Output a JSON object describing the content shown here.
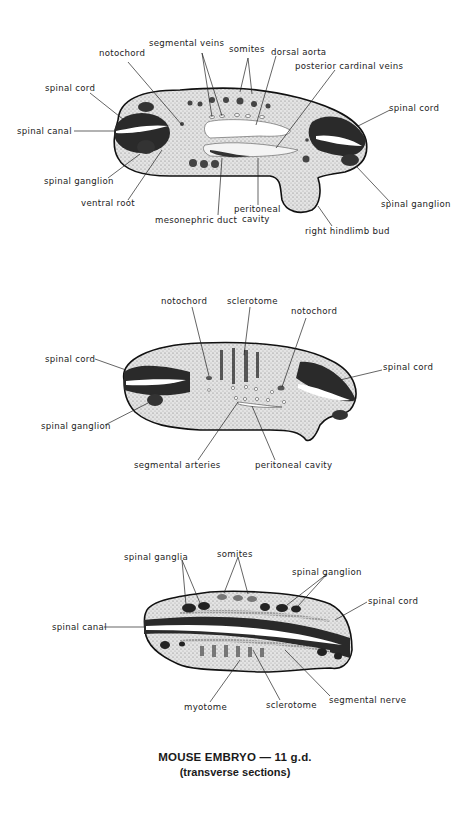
{
  "caption": {
    "title": "MOUSE EMBRYO — 11 g.d.",
    "subtitle": "(transverse sections)"
  },
  "section1": {
    "labels": {
      "notochord": "notochord",
      "segmental_veins": "segmental veins",
      "somites": "somites",
      "dorsal_aorta": "dorsal aorta",
      "posterior_cardinal_veins": "posterior cardinal veins",
      "spinal_cord_left": "spinal cord",
      "spinal_canal": "spinal  canal",
      "spinal_cord_right": "spinal cord",
      "spinal_ganglion_left": "spinal ganglion",
      "ventral_root": "ventral root",
      "mesonephric_duct": "mesonephric duct",
      "peritoneal_cavity_1": "peritoneal",
      "peritoneal_cavity_2": "cavity",
      "spinal_ganglion_right": "spinal ganglion",
      "right_hindlimb_bud": "right hindlimb bud"
    }
  },
  "section2": {
    "labels": {
      "notochord_left": "notochord",
      "sclerotome": "sclerotome",
      "notochord_right": "notochord",
      "spinal_cord_left": "spinal cord",
      "spinal_cord_right": "spinal cord",
      "spinal_ganglion": "spinal ganglion",
      "segmental_arteries": "segmental arteries",
      "peritoneal_cavity": "peritoneal cavity"
    }
  },
  "section3": {
    "labels": {
      "spinal_ganglia": "spinal ganglia",
      "somites": "somites",
      "spinal_ganglion": "spinal ganglion",
      "spinal_cord": "spinal cord",
      "spinal_canal": "spinal canal",
      "myotome": "myotome",
      "sclerotome": "sclerotome",
      "segmental_nerve": "segmental nerve"
    }
  }
}
